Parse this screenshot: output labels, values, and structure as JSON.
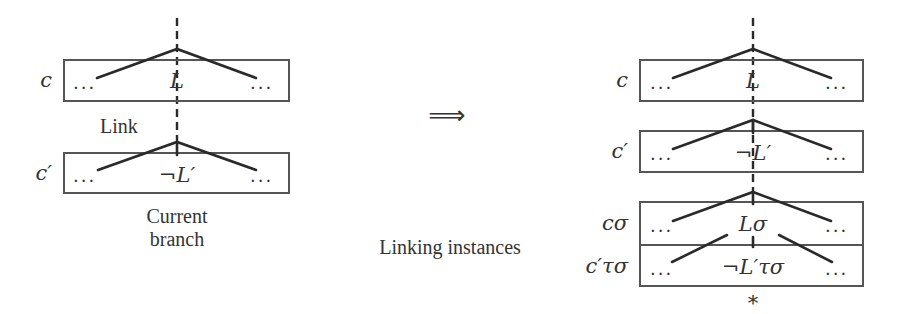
{
  "left": {
    "clause_top": {
      "name": "c",
      "literal": "L",
      "ellipsis_left": "...",
      "ellipsis_right": "..."
    },
    "clause_bottom": {
      "name": "c′",
      "literal": "¬L′",
      "ellipsis_left": "...",
      "ellipsis_right": "..."
    },
    "link_label": "Link",
    "caption_line1": "Current",
    "caption_line2": "branch"
  },
  "transition": {
    "arrow": "⟹",
    "caption": "Linking instances"
  },
  "right": {
    "clause_1": {
      "name": "c",
      "literal": "L",
      "ellipsis_left": "...",
      "ellipsis_right": "..."
    },
    "clause_2": {
      "name": "c′",
      "literal": "¬L′",
      "ellipsis_left": "...",
      "ellipsis_right": "..."
    },
    "clause_3": {
      "name": "cσ",
      "literal": "Lσ",
      "ellipsis_left": "...",
      "ellipsis_right": "..."
    },
    "clause_4": {
      "name": "c′τσ",
      "literal": "¬L′τσ",
      "ellipsis_left": "...",
      "ellipsis_right": "..."
    },
    "closed_marker": "*"
  },
  "colors": {
    "line": "#2a2a2a",
    "box": "#555555",
    "text": "#333333"
  }
}
